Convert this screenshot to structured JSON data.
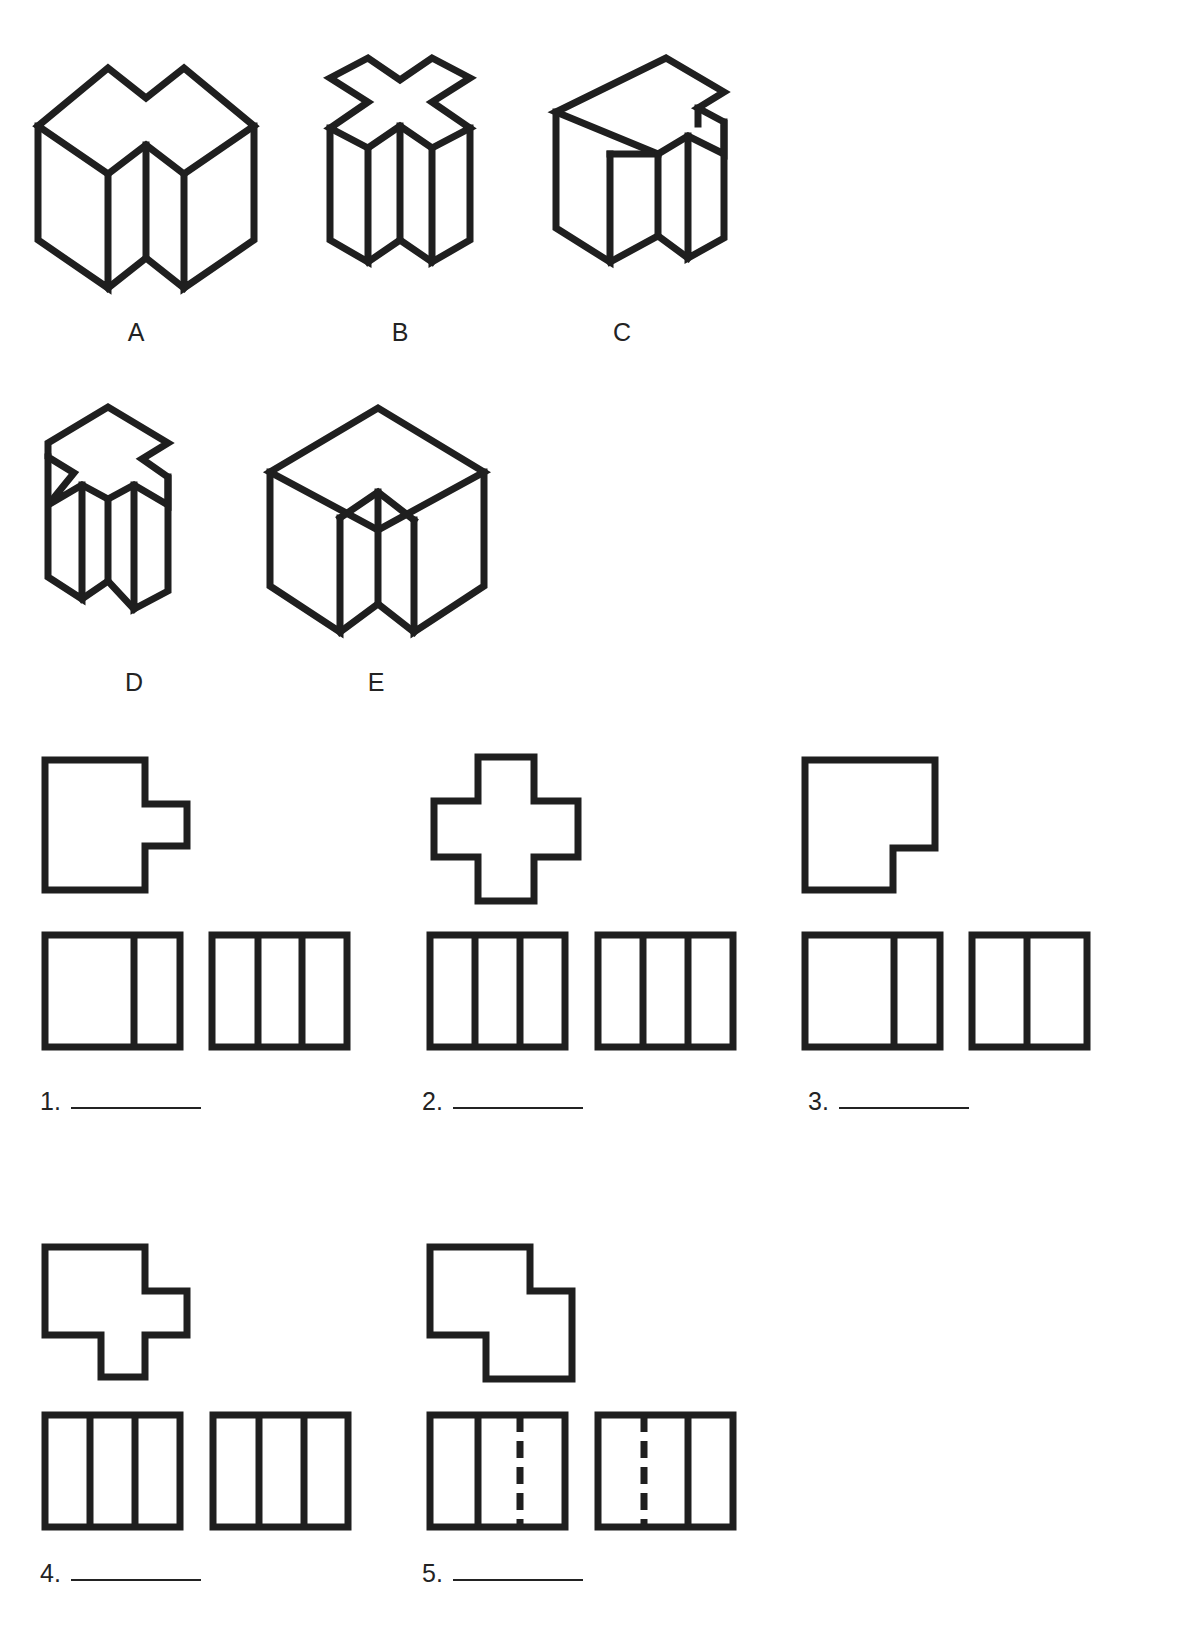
{
  "page": {
    "instruction": "",
    "background_color": "#ffffff",
    "line_color": "#1f1f1f"
  },
  "pictorials": {
    "heading": "",
    "items": [
      {
        "label": "A",
        "description": "isometric cube with rectangular notch cut down from top front corner forming a vertical groove"
      },
      {
        "label": "B",
        "description": "isometric cross-shaped (plus) prism, narrow, notched top and bottom"
      },
      {
        "label": "C",
        "description": "isometric cube with stepped notch cut from top right rear corner and vertical front groove"
      },
      {
        "label": "D",
        "description": "isometric cross-shaped prism with flat left face and notched top"
      },
      {
        "label": "E",
        "description": "isometric cube with vertical groove cut into the front vertical corner"
      }
    ]
  },
  "problems": [
    {
      "number": "1.",
      "answer_value": "",
      "top_view": {
        "name": "square with tab projecting from right side",
        "outline": "0,0 100,0 100,44 142,44 142,86 100,86 100,130 0,130"
      },
      "ortho_views": [
        {
          "panels": 2,
          "internal_lines": [
            {
              "x": 0.66,
              "style": "solid"
            }
          ]
        },
        {
          "panels": 3,
          "internal_lines": [
            {
              "x": 0.34,
              "style": "solid"
            },
            {
              "x": 0.67,
              "style": "solid"
            }
          ]
        }
      ]
    },
    {
      "number": "2.",
      "answer_value": "",
      "top_view": {
        "name": "plus / cross shape",
        "outline": "44,0 100,0 100,44 144,44 144,100 100,100 100,144 44,144 44,100 0,100 0,44 44,44"
      },
      "ortho_views": [
        {
          "panels": 3,
          "internal_lines": [
            {
              "x": 0.33,
              "style": "solid"
            },
            {
              "x": 0.66,
              "style": "solid"
            }
          ]
        },
        {
          "panels": 3,
          "internal_lines": [
            {
              "x": 0.33,
              "style": "solid"
            },
            {
              "x": 0.66,
              "style": "solid"
            }
          ]
        }
      ]
    },
    {
      "number": "3.",
      "answer_value": "",
      "top_view": {
        "name": "square with small notch cut from bottom right corner",
        "outline": "0,0 130,0 130,88 88,88 88,130 0,130"
      },
      "ortho_views": [
        {
          "panels": 2,
          "internal_lines": [
            {
              "x": 0.66,
              "style": "solid"
            }
          ]
        },
        {
          "panels": 2,
          "internal_lines": [
            {
              "x": 0.48,
              "style": "solid"
            }
          ]
        }
      ]
    },
    {
      "number": "4.",
      "answer_value": "",
      "top_view": {
        "name": "square with right tab and bottom tab",
        "outline": "0,0 100,0 100,44 142,44 142,88 100,88 100,130 56,130 56,88 0,88"
      },
      "ortho_views": [
        {
          "panels": 3,
          "internal_lines": [
            {
              "x": 0.33,
              "style": "solid"
            },
            {
              "x": 0.66,
              "style": "solid"
            }
          ]
        },
        {
          "panels": 3,
          "internal_lines": [
            {
              "x": 0.34,
              "style": "solid"
            },
            {
              "x": 0.67,
              "style": "solid"
            }
          ]
        }
      ]
    },
    {
      "number": "5.",
      "answer_value": "",
      "top_view": {
        "name": "stepped Z shape",
        "outline": "0,0 100,0 100,44 142,44 142,132 56,132 56,88 0,88"
      },
      "ortho_views": [
        {
          "panels": 3,
          "internal_lines": [
            {
              "x": 0.36,
              "style": "solid"
            },
            {
              "x": 0.66,
              "style": "dashed"
            }
          ]
        },
        {
          "panels": 3,
          "internal_lines": [
            {
              "x": 0.34,
              "style": "dashed"
            },
            {
              "x": 0.66,
              "style": "solid"
            }
          ]
        }
      ]
    }
  ]
}
